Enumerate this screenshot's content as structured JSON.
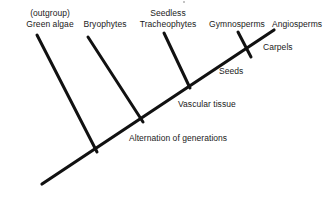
{
  "figure": {
    "type": "cladogram",
    "background_color": "#ffffff",
    "line_color": "#111111",
    "text_color": "#1a1a1a"
  },
  "taxa": [
    {
      "id": "green-algae",
      "line1": "(outgroup)",
      "line2": "Green algae",
      "tip_x": 55,
      "label_x": 50,
      "label_y": 8
    },
    {
      "id": "bryophytes",
      "line1": "",
      "line2": "Bryophytes",
      "tip_x": 105,
      "label_x": 105,
      "label_y": 18.5
    },
    {
      "id": "seedless-tracheophytes",
      "line1": "Seedless",
      "line2": "Tracheophytes",
      "tip_x": 168,
      "label_x": 168,
      "label_y": 8
    },
    {
      "id": "gymnosperms",
      "line1": "",
      "line2": "Gymnosperms",
      "tip_x": 237,
      "label_x": 237,
      "label_y": 18.5
    },
    {
      "id": "angiosperms",
      "line1": "",
      "line2": "Angiosperms",
      "tip_x": 297,
      "label_x": 297,
      "label_y": 18.5
    }
  ],
  "traits": [
    {
      "id": "alternation-of-generations",
      "label": "Alternation of generations",
      "x": 129,
      "y": 133
    },
    {
      "id": "vascular-tissue",
      "label": "Vascular tissue",
      "x": 178,
      "y": 99
    },
    {
      "id": "seeds",
      "label": "Seeds",
      "x": 219,
      "y": 66
    },
    {
      "id": "carpels",
      "label": "Carpels",
      "x": 263,
      "y": 42
    }
  ],
  "geometry": {
    "backbone": {
      "x1": 42,
      "y1": 184,
      "x2": 274,
      "y2": 30
    },
    "branches": [
      {
        "id": "branch-green-algae",
        "x1": 37,
        "y1": 35,
        "x2": 97,
        "y2": 152
      },
      {
        "id": "branch-bryophytes",
        "x1": 88,
        "y1": 37,
        "x2": 143,
        "y2": 122
      },
      {
        "id": "branch-seedless-tracheophytes",
        "x1": 164,
        "y1": 33,
        "x2": 190,
        "y2": 88
      },
      {
        "id": "branch-gymnosperms",
        "x1": 238,
        "y1": 32,
        "x2": 251,
        "y2": 57
      }
    ],
    "nodes": [
      {
        "id": "node-green-algae",
        "x": 97,
        "y": 152
      },
      {
        "id": "node-bryophytes",
        "x": 143,
        "y": 122
      },
      {
        "id": "node-seedless-tracheophytes",
        "x": 190,
        "y": 88
      },
      {
        "id": "node-gymnosperms",
        "x": 251,
        "y": 57
      }
    ]
  },
  "artifacts": [
    {
      "id": "top-speck",
      "x": 183,
      "y": 1,
      "size": 1.6
    }
  ]
}
